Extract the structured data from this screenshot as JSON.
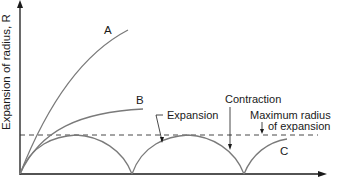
{
  "diagram": {
    "y_axis_label": "Expansion of radius, R",
    "curve_labels": {
      "a": "A",
      "b": "B",
      "c": "C"
    },
    "annotations": {
      "expansion": "Expansion",
      "contraction": "Contraction",
      "max_radius_line1": "Maximum radius",
      "max_radius_line2": "of expansion"
    },
    "colors": {
      "curve": "#7a7a7a",
      "axis": "#1a1a1a",
      "text": "#1a1a1a"
    }
  }
}
